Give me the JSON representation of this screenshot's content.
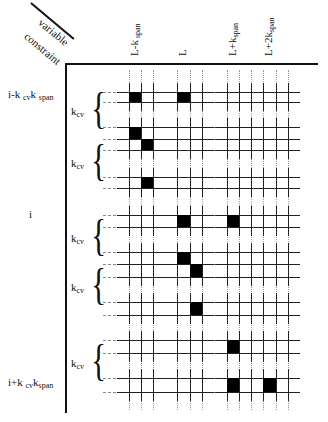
{
  "corner": {
    "top_label": "variable",
    "bottom_label": "constraint"
  },
  "columns": [
    {
      "base": "L-k",
      "sub": " span",
      "x": 129
    },
    {
      "base": "L",
      "sub": "",
      "x": 177
    },
    {
      "base": "L+k",
      "sub": "span",
      "x": 227
    },
    {
      "base": "L+2k",
      "sub": "span",
      "x": 263
    }
  ],
  "rows": {
    "top": {
      "base": "i-k ",
      "sub1": "cv",
      "mid": "k ",
      "sub2": "span"
    },
    "middle": {
      "text": "i"
    },
    "bottom": {
      "base": "i+k ",
      "sub1": "cv",
      "mid": "k",
      "sub2": "span"
    }
  },
  "brace_label": {
    "base": "k",
    "sub": "cv"
  },
  "braces": [
    {
      "center_y": 113
    },
    {
      "center_y": 165
    },
    {
      "center_y": 240
    },
    {
      "center_y": 289
    },
    {
      "center_y": 365
    }
  ],
  "grid": {
    "column_group_lines_x": [
      [
        129,
        141,
        153
      ],
      [
        177,
        190,
        202
      ],
      [
        227,
        239,
        251
      ],
      [
        263,
        276,
        288
      ]
    ],
    "row_lines_y": [
      92,
      102,
      127,
      139,
      150,
      177,
      188,
      215,
      227,
      252,
      264,
      277,
      302,
      315,
      340,
      353,
      378,
      392
    ]
  },
  "filled_cells": [
    {
      "x": 129,
      "y": 92,
      "w": 12,
      "h": 10
    },
    {
      "x": 177,
      "y": 92,
      "w": 13,
      "h": 10
    },
    {
      "x": 129,
      "y": 127,
      "w": 12,
      "h": 12
    },
    {
      "x": 141,
      "y": 139,
      "w": 12,
      "h": 11
    },
    {
      "x": 141,
      "y": 177,
      "w": 12,
      "h": 11
    },
    {
      "x": 177,
      "y": 215,
      "w": 13,
      "h": 12
    },
    {
      "x": 227,
      "y": 215,
      "w": 12,
      "h": 12
    },
    {
      "x": 177,
      "y": 252,
      "w": 13,
      "h": 12
    },
    {
      "x": 190,
      "y": 264,
      "w": 12,
      "h": 13
    },
    {
      "x": 190,
      "y": 302,
      "w": 12,
      "h": 13
    },
    {
      "x": 227,
      "y": 340,
      "w": 12,
      "h": 13
    },
    {
      "x": 227,
      "y": 378,
      "w": 12,
      "h": 14
    },
    {
      "x": 263,
      "y": 378,
      "w": 13,
      "h": 14
    }
  ],
  "colors": {
    "ink": "#000000",
    "background": "#ffffff"
  }
}
